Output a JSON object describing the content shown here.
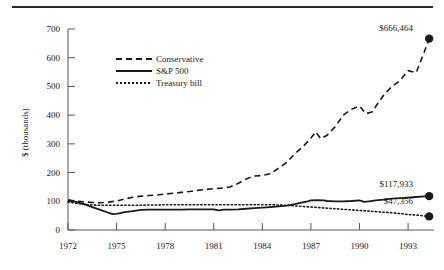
{
  "chart_data": {
    "type": "line",
    "title": "",
    "xlabel": "",
    "ylabel": "$ (thousands)",
    "xlim": [
      1972,
      1994.6
    ],
    "ylim": [
      0,
      720
    ],
    "grid": false,
    "legend_position": "upper-left-inside",
    "xticks": [
      "1972",
      "1975",
      "1978",
      "1981",
      "1984",
      "1987",
      "1990",
      "1993"
    ],
    "xtick_values": [
      1972,
      1975,
      1978,
      1981,
      1984,
      1987,
      1990,
      1993
    ],
    "yticks": [
      "0",
      "100",
      "200",
      "300",
      "400",
      "500",
      "600",
      "700"
    ],
    "ytick_values": [
      0,
      100,
      200,
      300,
      400,
      500,
      600,
      700
    ],
    "series": [
      {
        "name": "Conservative",
        "style": "dashed",
        "color": "#1a1a1a",
        "endpoint_label": "$666,464",
        "endpoint_value": 666.464,
        "x": [
          1972,
          1972.5,
          1973,
          1973.5,
          1974,
          1974.5,
          1975,
          1975.5,
          1976,
          1976.5,
          1977,
          1977.5,
          1978,
          1978.5,
          1979,
          1979.5,
          1980,
          1980.5,
          1981,
          1981.5,
          1982,
          1982.5,
          1983,
          1983.5,
          1984,
          1984.5,
          1985,
          1985.5,
          1986,
          1986.5,
          1987,
          1987.3,
          1987.6,
          1988,
          1988.5,
          1989,
          1989.5,
          1990,
          1990.4,
          1990.8,
          1991,
          1991.5,
          1992,
          1992.5,
          1993,
          1993.5,
          1994,
          1994.3
        ],
        "y": [
          104,
          101,
          98,
          96,
          95,
          97,
          101,
          108,
          114,
          118,
          120,
          122,
          125,
          128,
          131,
          134,
          138,
          141,
          144,
          146,
          150,
          162,
          178,
          188,
          190,
          196,
          215,
          235,
          265,
          290,
          320,
          342,
          318,
          330,
          360,
          400,
          420,
          432,
          405,
          412,
          430,
          470,
          500,
          520,
          555,
          548,
          620,
          666.464
        ]
      },
      {
        "name": "S&P 500",
        "style": "solid",
        "color": "#1a1a1a",
        "endpoint_label": "$117,933",
        "endpoint_value": 117.933,
        "x": [
          1972,
          1972.5,
          1973,
          1973.5,
          1974,
          1974.5,
          1974.8,
          1975,
          1975.5,
          1976,
          1976.5,
          1977,
          1977.5,
          1978,
          1978.5,
          1979,
          1979.5,
          1980,
          1980.5,
          1981,
          1981.3,
          1981.6,
          1982,
          1982.5,
          1983,
          1983.5,
          1984,
          1984.5,
          1985,
          1985.5,
          1986,
          1986.5,
          1986.8,
          1987,
          1987.4,
          1987.8,
          1988,
          1988.5,
          1989,
          1989.5,
          1990,
          1990.3,
          1990.6,
          1991,
          1991.5,
          1992,
          1992.5,
          1993,
          1993.5,
          1994,
          1994.3
        ],
        "y": [
          104,
          98,
          90,
          80,
          70,
          60,
          55,
          56,
          62,
          66,
          70,
          71,
          71,
          71,
          71,
          71,
          72,
          72,
          72,
          72,
          68,
          71,
          71,
          72,
          74,
          76,
          78,
          80,
          82,
          85,
          90,
          96,
          100,
          103,
          104,
          103,
          101,
          100,
          100,
          101,
          103,
          98,
          100,
          103,
          106,
          109,
          111,
          113,
          115,
          117,
          117.933
        ]
      },
      {
        "name": "Treasury bill",
        "style": "dotted",
        "color": "#1a1a1a",
        "endpoint_label": "$47,356",
        "endpoint_value": 47.356,
        "x": [
          1972,
          1972.5,
          1973,
          1973.5,
          1974,
          1974.5,
          1975,
          1975.5,
          1976,
          1976.5,
          1977,
          1977.5,
          1978,
          1978.5,
          1979,
          1979.5,
          1980,
          1980.5,
          1981,
          1981.5,
          1982,
          1982.5,
          1983,
          1983.5,
          1984,
          1984.5,
          1985,
          1985.5,
          1986,
          1986.5,
          1987,
          1987.5,
          1988,
          1988.5,
          1989,
          1989.5,
          1990,
          1990.5,
          1991,
          1991.5,
          1992,
          1992.5,
          1993,
          1993.5,
          1994,
          1994.3
        ],
        "y": [
          98,
          93,
          89,
          87,
          86,
          86,
          86,
          86,
          86,
          86,
          87,
          87,
          88,
          88,
          88,
          88,
          88,
          88,
          88,
          88,
          88,
          88,
          88,
          88,
          88,
          88,
          87,
          86,
          84,
          82,
          80,
          78,
          76,
          74,
          72,
          70,
          68,
          66,
          64,
          62,
          60,
          57,
          54,
          52,
          49,
          47.356
        ]
      }
    ]
  },
  "figure": {
    "top_rule": "horizontal-rule"
  }
}
